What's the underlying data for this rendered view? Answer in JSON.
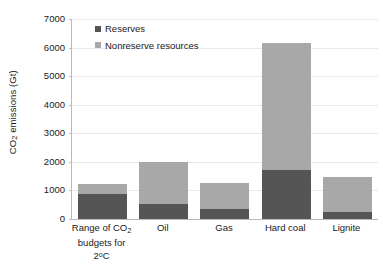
{
  "chart_data": {
    "type": "bar",
    "subtype": "stacked-bar",
    "title": "",
    "xlabel": "",
    "ylabel": "CO2 emissions (Gt)",
    "ylabel_parts": {
      "pre": "CO",
      "sub": "2",
      "post": " emissions (Gt)"
    },
    "ylim": [
      0,
      7000
    ],
    "yticks": [
      0,
      1000,
      2000,
      3000,
      4000,
      5000,
      6000,
      7000
    ],
    "ytick_labels": [
      "0",
      "1000",
      "2000",
      "3000",
      "4000",
      "5000",
      "6000",
      "7000"
    ],
    "grid": true,
    "grid_axis": "y",
    "legend_position": "top-left-inside",
    "categories": [
      "Range of CO2 budgets for 2ºC",
      "Oil",
      "Gas",
      "Hard coal",
      "Lignite"
    ],
    "category_labels": [
      {
        "line1_pre": "Range of CO",
        "line1_sub": "2",
        "line2_pre": "budgets for 2",
        "line2_sup": "o",
        "line2_post": "C"
      },
      {
        "line1_pre": "Oil"
      },
      {
        "line1_pre": "Gas"
      },
      {
        "line1_pre": "Hard coal"
      },
      {
        "line1_pre": "Lignite"
      }
    ],
    "series": [
      {
        "name": "Reserves",
        "color": "#555555",
        "values": [
          880,
          530,
          360,
          1730,
          250
        ]
      },
      {
        "name": "Nonreserve resources",
        "color": "#a8a8a8",
        "values": [
          350,
          1480,
          910,
          4430,
          1210
        ]
      }
    ],
    "totals": [
      1230,
      2010,
      1270,
      6160,
      1460
    ],
    "units": "Gt"
  },
  "colors": {
    "reserves": "#555555",
    "nonreserve": "#a8a8a8",
    "axis": "#b9b9b9",
    "gridline": "#e9e9e9",
    "text": "#1a1a1a",
    "background": "#ffffff"
  }
}
